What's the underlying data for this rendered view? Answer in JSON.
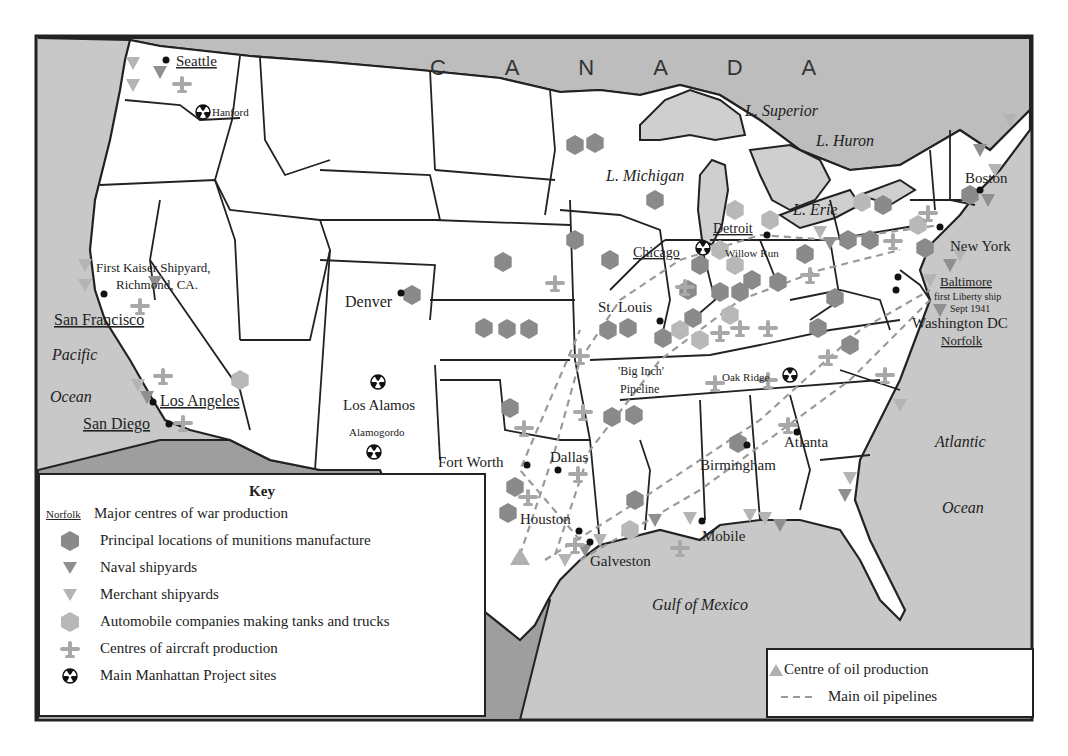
{
  "colors": {
    "sea": "#c8c8c8",
    "canada": "#bdbdbd",
    "mexico": "#9e9e9e",
    "land": "#ffffff",
    "lakes": "#cfcfcf",
    "munitions": "#8a8a8a",
    "naval": "#8f8f8f",
    "merchant": "#b4b4b4",
    "automobile": "#b8b8b8",
    "aircraft": "#a8a8a8",
    "oil": "#b0b0b0",
    "pipeline": "#9a9a9a",
    "border": "#222222"
  },
  "regions": {
    "canada": "C A N A D A",
    "pacific_1": "Pacific",
    "pacific_2": "Ocean",
    "atlantic_1": "Atlantic",
    "atlantic_2": "Ocean",
    "gulf": "Gulf of Mexico",
    "superior": "L. Superior",
    "huron": "L. Huron",
    "michigan": "L. Michigan",
    "erie": "L. Erie"
  },
  "cities": {
    "seattle": "Seattle",
    "hanford": "Hanford",
    "kaiser_1": "First Kaiser Shipyard,",
    "kaiser_2": "Richmond, CA.",
    "san_francisco": "San Francisco",
    "los_angeles": "Los Angeles",
    "san_diego": "San Diego",
    "denver": "Denver",
    "los_alamos": "Los Alamos",
    "alamogordo": "Alamogordo",
    "fort_worth": "Fort Worth",
    "dallas": "Dallas",
    "houston": "Houston",
    "galveston": "Galveston",
    "mobile": "Mobile",
    "st_louis": "St. Louis",
    "big_inch_1": "'Big Inch'",
    "big_inch_2": "Pipeline",
    "oak_ridge": "Oak Ridge",
    "birmingham": "Birmingham",
    "atlanta": "Atlanta",
    "chicago": "Chicago",
    "detroit": "Detroit",
    "willow_run": "Willow Run",
    "boston": "Boston",
    "new_york": "New York",
    "baltimore": "Baltimore",
    "liberty_1": "first Liberty ship",
    "liberty_2": "Sept 1941",
    "washington": "Washington DC",
    "norfolk": "Norfolk"
  },
  "key": {
    "title": "Key",
    "items": [
      {
        "symbol": "Norfolk",
        "label": "Major centres of war production"
      },
      {
        "symbol": "munitions-hexagon",
        "label": "Principal locations of munitions manufacture"
      },
      {
        "symbol": "naval-triangle",
        "label": "Naval shipyards"
      },
      {
        "symbol": "merchant-triangle",
        "label": "Merchant shipyards"
      },
      {
        "symbol": "automobile-hexagon",
        "label": "Automobile companies making tanks and trucks"
      },
      {
        "symbol": "aircraft-plane",
        "label": "Centres of aircraft production"
      },
      {
        "symbol": "radiation-trefoil",
        "label": "Main Manhattan Project sites"
      }
    ]
  },
  "key2": {
    "items": [
      {
        "symbol": "oil-triangle",
        "label": "Centre of oil production"
      },
      {
        "symbol": "dashed-line",
        "label": "Main oil pipelines"
      }
    ]
  }
}
